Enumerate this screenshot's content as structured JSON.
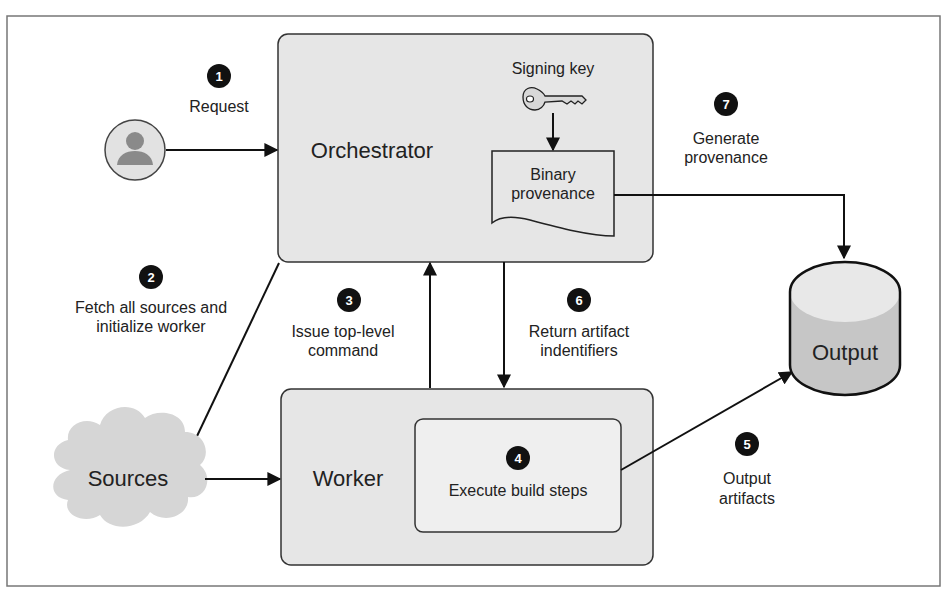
{
  "nodes": {
    "orchestrator": "Orchestrator",
    "worker": "Worker",
    "sources": "Sources",
    "output": "Output",
    "signing_key": "Signing key",
    "binary_provenance": [
      "Binary",
      "provenance"
    ],
    "execute_build_steps": "Execute build steps"
  },
  "steps": [
    {
      "number": "1",
      "label": [
        "Request"
      ]
    },
    {
      "number": "2",
      "label": [
        "Fetch all sources and",
        "initialize worker"
      ]
    },
    {
      "number": "3",
      "label": [
        "Issue top-level",
        "command"
      ]
    },
    {
      "number": "4",
      "label": [
        "Execute build steps"
      ]
    },
    {
      "number": "5",
      "label": [
        "Output",
        "artifacts"
      ]
    },
    {
      "number": "6",
      "label": [
        "Return artifact",
        "indentifiers"
      ]
    },
    {
      "number": "7",
      "label": [
        "Generate",
        "provenance"
      ]
    }
  ],
  "icons": {
    "user": "user-icon",
    "key": "key-icon",
    "cloud": "cloud-icon",
    "database": "database-cylinder-icon",
    "document": "document-icon"
  },
  "colors": {
    "box_fill": "#e6e6e6",
    "inner_fill": "#efefef",
    "stroke": "#222222",
    "frame": "#777777",
    "badge": "#111111",
    "cloud": "#d6d6d6",
    "cylinder_top": "#e8e8e8",
    "cylinder_body": "#c6c6c6",
    "user_fill": "#e2e2e2",
    "user_glyph": "#8a8a8a"
  }
}
